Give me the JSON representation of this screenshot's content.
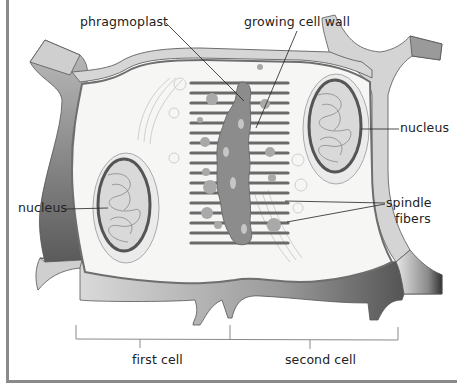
{
  "diagram": {
    "labels": {
      "phragmoplast": "phragmoplast",
      "growing_cell_wall": "growing cell wall",
      "nucleus_right": "nucleus",
      "nucleus_left": "nucleus",
      "spindle_fibers_line1": "spindle",
      "spindle_fibers_line2": "fibers",
      "first_cell": "first cell",
      "second_cell": "second cell"
    },
    "colors": {
      "cell_wall_light": "#d9d9d9",
      "cell_wall_dark": "#7a7a7a",
      "cytoplasm": "#f7f7f5",
      "membrane": "#6e6e6e",
      "fibers": "#6a6a6a",
      "phragmoplast": "#8c8c8c",
      "nucleus_envelope": "#555555",
      "frame": "#8a8a8a"
    }
  }
}
